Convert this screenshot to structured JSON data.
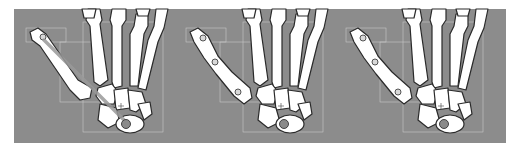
{
  "figure": {
    "background_color": "#8c8c8c",
    "bone_color": "#ffffff",
    "panels": [
      {
        "id": "panel-1",
        "label": "",
        "thumb_pose": "abducted-with-axis-line"
      },
      {
        "id": "panel-2",
        "label": "",
        "thumb_pose": "flexed-with-joint-markers"
      },
      {
        "id": "panel-3",
        "label": "",
        "thumb_pose": "flexed-with-joint-markers"
      }
    ]
  }
}
